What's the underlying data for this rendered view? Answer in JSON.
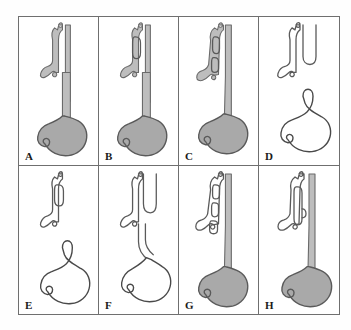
{
  "figure": {
    "kind": "medical-diagram",
    "panel_count": 8,
    "rows": 2,
    "columns": 4,
    "colors": {
      "page_background": "#fefefe",
      "panel_background": "#ffffff",
      "frame_stroke": "#6f6f6f",
      "outline_stroke": "#4a4a4a",
      "stomach_fill_shaded": "#a9a9a9",
      "stomach_fill_unshaded": "#ffffff",
      "tube_fill": "#bdbdbd",
      "label_color": "#1a1a1a"
    }
  },
  "panels": [
    {
      "id": "panel-a",
      "label": "A",
      "row": 1,
      "column": 1,
      "stomach_shaded": true,
      "esophagus_continuous": true,
      "upper_pouch": false,
      "tracheal_segments": 0,
      "stomach_present": true
    },
    {
      "id": "panel-b",
      "label": "B",
      "row": 1,
      "column": 2,
      "stomach_shaded": true,
      "esophagus_continuous": true,
      "upper_pouch": true,
      "tracheal_segments": 1,
      "stomach_present": true
    },
    {
      "id": "panel-c",
      "label": "C",
      "row": 1,
      "column": 3,
      "stomach_shaded": true,
      "esophagus_continuous": true,
      "upper_pouch": true,
      "tracheal_segments": 2,
      "stomach_present": true
    },
    {
      "id": "panel-d",
      "label": "D",
      "row": 1,
      "column": 4,
      "stomach_shaded": false,
      "esophagus_continuous": false,
      "upper_pouch": true,
      "tracheal_segments": 0,
      "stomach_present": true
    },
    {
      "id": "panel-e",
      "label": "E",
      "row": 2,
      "column": 1,
      "stomach_shaded": false,
      "esophagus_continuous": false,
      "upper_pouch": true,
      "tracheal_segments": 1,
      "stomach_present": true
    },
    {
      "id": "panel-f",
      "label": "F",
      "row": 2,
      "column": 2,
      "stomach_shaded": false,
      "esophagus_continuous": true,
      "upper_pouch": true,
      "tracheal_segments": 0,
      "stomach_present": true
    },
    {
      "id": "panel-g",
      "label": "G",
      "row": 2,
      "column": 3,
      "stomach_shaded": true,
      "esophagus_continuous": true,
      "upper_pouch": false,
      "tracheal_segments": 3,
      "stomach_present": true
    },
    {
      "id": "panel-h",
      "label": "H",
      "row": 2,
      "column": 4,
      "stomach_shaded": true,
      "esophagus_continuous": true,
      "upper_pouch": true,
      "tracheal_segments": 1,
      "stomach_present": true
    }
  ]
}
